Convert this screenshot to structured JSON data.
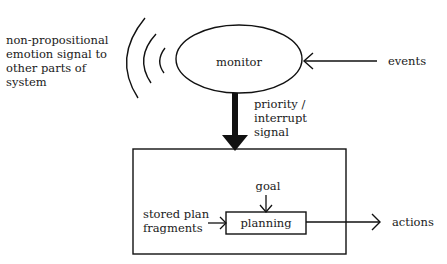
{
  "diagram": {
    "title": "",
    "nodes": {
      "monitor": {
        "label": "monitor",
        "shape": "ellipse"
      },
      "control_system": {
        "label": "",
        "shape": "rectangle"
      },
      "planning": {
        "label": "planning",
        "shape": "rectangle"
      }
    },
    "external_labels": {
      "emotion_signal": [
        "non-propositional",
        "emotion signal to",
        "other parts of",
        "system"
      ],
      "events": "events",
      "priority_signal": [
        "priority /",
        "interrupt",
        "signal"
      ],
      "goal": "goal",
      "stored_plan": [
        "stored plan",
        "fragments"
      ],
      "actions": "actions"
    },
    "edges": [
      {
        "from": "events",
        "to": "monitor",
        "style": "thin-arrow"
      },
      {
        "from": "monitor",
        "to": "control_system",
        "style": "thick-arrow",
        "label": "priority / interrupt signal"
      },
      {
        "from": "goal",
        "to": "planning",
        "style": "thin-arrow"
      },
      {
        "from": "stored plan fragments",
        "to": "planning",
        "style": "thin-arrow"
      },
      {
        "from": "planning",
        "to": "actions",
        "style": "thin-arrow"
      },
      {
        "from": "monitor",
        "to": "other parts of system",
        "style": "radiating-arcs",
        "label": "non-propositional emotion signal to other parts of system"
      }
    ],
    "colors": {
      "ink": "#111111",
      "background": "#ffffff"
    }
  }
}
